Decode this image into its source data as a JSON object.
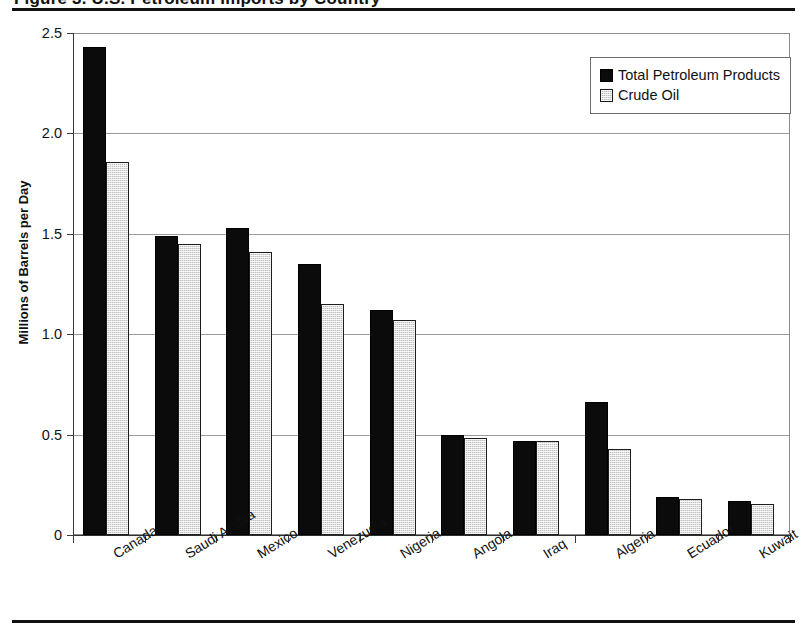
{
  "page": {
    "title_clipped": "Figure 3. U.S. Petroleum Imports by Country",
    "rule_color": "#111111"
  },
  "chart_data": {
    "type": "bar",
    "title": "",
    "xlabel": "",
    "ylabel": "Millions of Barrels per Day",
    "ylim": [
      0,
      2.5
    ],
    "ytick_values": [
      0,
      0.5,
      1.0,
      1.5,
      2.0,
      2.5
    ],
    "ytick_labels": [
      "0",
      "0.5",
      "1.0",
      "1.5",
      "2.0",
      "2.5"
    ],
    "grid": true,
    "legend_position": "top-right",
    "categories": [
      "Canada",
      "Saudi Arabia",
      "Mexico",
      "Venezuela",
      "Nigeria",
      "Angola",
      "Iraq",
      "Algeria",
      "Ecuador",
      "Kuwait"
    ],
    "series": [
      {
        "name": "Total Petroleum Products",
        "color": "#0b0b0b",
        "values": [
          2.43,
          1.49,
          1.53,
          1.35,
          1.12,
          0.5,
          0.47,
          0.66,
          0.19,
          0.17
        ]
      },
      {
        "name": "Crude Oil",
        "color": "#bdbdbd",
        "values": [
          1.86,
          1.45,
          1.41,
          1.15,
          1.07,
          0.485,
          0.47,
          0.43,
          0.18,
          0.155
        ]
      }
    ]
  },
  "legend": {
    "items": [
      {
        "label": "Total Petroleum Products"
      },
      {
        "label": "Crude Oil"
      }
    ]
  }
}
